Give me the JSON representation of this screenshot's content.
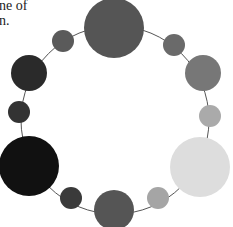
{
  "caption": {
    "line1": "ne of",
    "line2": "n."
  },
  "diagram": {
    "type": "circular ring of nodes",
    "ring": {
      "cx": 115,
      "cy": 120,
      "r": 94,
      "stroke": "#555555"
    },
    "nodes": [
      {
        "id": "top-large",
        "cx": 114,
        "cy": 28,
        "r": 30,
        "color": "#555555"
      },
      {
        "id": "upper-right-small",
        "cx": 174,
        "cy": 45,
        "r": 11,
        "color": "#6a6a6a"
      },
      {
        "id": "right-medium",
        "cx": 203,
        "cy": 73,
        "r": 18,
        "color": "#777777"
      },
      {
        "id": "right-small",
        "cx": 210,
        "cy": 116,
        "r": 11,
        "color": "#aaaaaa"
      },
      {
        "id": "lower-right-large",
        "cx": 200,
        "cy": 167,
        "r": 30,
        "color": "#dddddd"
      },
      {
        "id": "bottom-right-small",
        "cx": 158,
        "cy": 198,
        "r": 11,
        "color": "#a5a5a5"
      },
      {
        "id": "bottom-medium",
        "cx": 114,
        "cy": 210,
        "r": 20,
        "color": "#555555"
      },
      {
        "id": "bottom-left-small",
        "cx": 71,
        "cy": 198,
        "r": 11,
        "color": "#3a3a3a"
      },
      {
        "id": "lower-left-large",
        "cx": 29,
        "cy": 166,
        "r": 30,
        "color": "#111111"
      },
      {
        "id": "left-small",
        "cx": 19,
        "cy": 112,
        "r": 11,
        "color": "#333333"
      },
      {
        "id": "left-medium",
        "cx": 29,
        "cy": 73,
        "r": 18,
        "color": "#2a2a2a"
      },
      {
        "id": "upper-left-small",
        "cx": 63,
        "cy": 41,
        "r": 11,
        "color": "#5a5a5a"
      }
    ]
  }
}
